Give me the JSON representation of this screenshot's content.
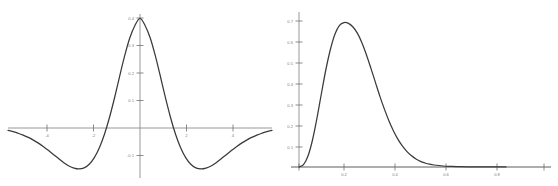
{
  "figure": {
    "background_color": "#ffffff",
    "curve_color": "#3a3a3a",
    "axis_color": "#8c8c8c",
    "label_color": "#808080",
    "panel_count": 2
  },
  "chart_data": [
    {
      "type": "line",
      "title": "",
      "subtitle": "",
      "xlabel": "",
      "ylabel": "",
      "position": "left",
      "grid": false,
      "legend": "none",
      "xlim": [
        -5.2,
        5.2
      ],
      "ylim": [
        -0.19,
        0.42
      ],
      "xticks": [
        -4,
        -2,
        2,
        4
      ],
      "xticklabels": [
        "-4",
        "-2",
        "2",
        "4"
      ],
      "yticks": [
        0.1,
        0.2,
        0.3,
        0.4,
        -0.1
      ],
      "yticklabels": [
        "0.1",
        "0.2",
        "0.3",
        "0.4",
        "-0.1"
      ],
      "annotations": [],
      "series": [
        {
          "name": "mexican-hat-wavelet",
          "x": [
            -5.2,
            -5.0,
            -4.8,
            -4.6,
            -4.4,
            -4.2,
            -4.0,
            -3.8,
            -3.6,
            -3.4,
            -3.2,
            -3.0,
            -2.8,
            -2.6,
            -2.4,
            -2.2,
            -2.0,
            -1.8,
            -1.6,
            -1.4,
            -1.2,
            -1.0,
            -0.8,
            -0.6,
            -0.4,
            -0.2,
            0.0,
            0.2,
            0.4,
            0.6,
            0.8,
            1.0,
            1.2,
            1.4,
            1.6,
            1.8,
            2.0,
            2.2,
            2.4,
            2.6,
            2.8,
            3.0,
            3.2,
            3.4,
            3.6,
            3.8,
            4.0,
            4.2,
            4.4,
            4.6,
            4.8,
            5.0,
            5.2
          ],
          "y": [
            -0.009,
            -0.013,
            -0.019,
            -0.026,
            -0.034,
            -0.044,
            -0.055,
            -0.068,
            -0.082,
            -0.097,
            -0.112,
            -0.126,
            -0.138,
            -0.146,
            -0.149,
            -0.145,
            -0.132,
            -0.108,
            -0.072,
            -0.023,
            0.039,
            0.111,
            0.189,
            0.264,
            0.328,
            0.373,
            0.399,
            0.373,
            0.328,
            0.264,
            0.189,
            0.111,
            0.039,
            -0.023,
            -0.072,
            -0.108,
            -0.132,
            -0.145,
            -0.149,
            -0.146,
            -0.138,
            -0.126,
            -0.112,
            -0.097,
            -0.082,
            -0.068,
            -0.055,
            -0.044,
            -0.034,
            -0.026,
            -0.019,
            -0.013,
            -0.009
          ]
        }
      ],
      "peak": {
        "x": 0.0,
        "y": 0.4
      },
      "troughs": [
        {
          "x": -2.4,
          "y": -0.15
        },
        {
          "x": 2.4,
          "y": -0.15
        }
      ]
    },
    {
      "type": "line",
      "title": "",
      "subtitle": "",
      "xlabel": "",
      "ylabel": "",
      "position": "right",
      "grid": false,
      "legend": "none",
      "xlim": [
        0.0,
        0.92
      ],
      "ylim": [
        0.0,
        0.78
      ],
      "xticks": [
        0.2,
        0.4,
        0.6,
        0.8
      ],
      "xticklabels": [
        "0.2",
        "0.4",
        "0.6",
        "0.8"
      ],
      "yticks": [
        0.1,
        0.2,
        0.3,
        0.4,
        0.5,
        0.6,
        0.7
      ],
      "yticklabels": [
        "0.1",
        "0.2",
        "0.3",
        "0.4",
        "0.5",
        "0.6",
        "0.7"
      ],
      "annotations": [],
      "series": [
        {
          "name": "skewed-density",
          "x": [
            0.0,
            0.02,
            0.04,
            0.06,
            0.08,
            0.1,
            0.12,
            0.14,
            0.16,
            0.18,
            0.2,
            0.22,
            0.24,
            0.26,
            0.28,
            0.3,
            0.32,
            0.34,
            0.36,
            0.38,
            0.4,
            0.42,
            0.44,
            0.46,
            0.48,
            0.5,
            0.52,
            0.54,
            0.56,
            0.58,
            0.6,
            0.64,
            0.68,
            0.72,
            0.76,
            0.8,
            0.84,
            0.88,
            0.92
          ],
          "y": [
            0.0,
            0.012,
            0.055,
            0.135,
            0.245,
            0.37,
            0.49,
            0.59,
            0.665,
            0.708,
            0.722,
            0.718,
            0.7,
            0.668,
            0.62,
            0.56,
            0.492,
            0.422,
            0.352,
            0.288,
            0.23,
            0.18,
            0.138,
            0.104,
            0.077,
            0.056,
            0.04,
            0.028,
            0.02,
            0.014,
            0.01,
            0.005,
            0.003,
            0.0015,
            0.001,
            0.0005,
            0.0003,
            0.0002,
            0.0001
          ]
        }
      ],
      "peak": {
        "x": 0.22,
        "y": 0.72
      },
      "troughs": []
    }
  ]
}
